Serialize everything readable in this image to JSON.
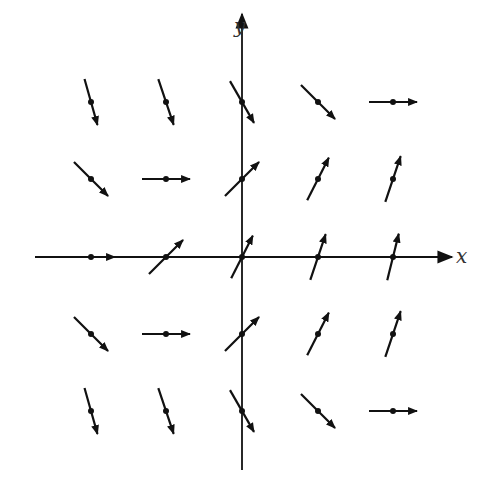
{
  "diagram": {
    "title": "",
    "type": "direction-field",
    "axes": {
      "x_label": "x",
      "y_label": "y",
      "origin_px": [
        242,
        257
      ],
      "x_axis_px": [
        35,
        452
      ],
      "y_axis_px": [
        470,
        14
      ],
      "color": "#111111"
    },
    "grid": {
      "x_values": [
        -2,
        -1,
        0,
        1,
        2
      ],
      "y_values": [
        2,
        1,
        0,
        -1,
        -2
      ],
      "x_px": [
        91,
        166,
        242,
        318,
        393
      ],
      "y_px": [
        102,
        179,
        257,
        334,
        411
      ]
    },
    "arrow_color": "#111111",
    "arrows": [
      {
        "x": -2,
        "y": 2,
        "dx": 0.27,
        "dy": 0.96
      },
      {
        "x": -1,
        "y": 2,
        "dx": 0.32,
        "dy": 0.95
      },
      {
        "x": 0,
        "y": 2,
        "dx": 0.5,
        "dy": 0.87
      },
      {
        "x": 1,
        "y": 2,
        "dx": 0.71,
        "dy": 0.71
      },
      {
        "x": 2,
        "y": 2,
        "dx": 1.0,
        "dy": 0.0
      },
      {
        "x": -2,
        "y": 1,
        "dx": 0.71,
        "dy": 0.71
      },
      {
        "x": -1,
        "y": 1,
        "dx": 1.0,
        "dy": 0.0
      },
      {
        "x": 0,
        "y": 1,
        "dx": 0.71,
        "dy": -0.71
      },
      {
        "x": 1,
        "y": 1,
        "dx": 0.45,
        "dy": -0.89
      },
      {
        "x": 2,
        "y": 1,
        "dx": 0.32,
        "dy": -0.95
      },
      {
        "x": -2,
        "y": 0,
        "dx": 1.0,
        "dy": 0.0
      },
      {
        "x": -1,
        "y": 0,
        "dx": 0.71,
        "dy": -0.71
      },
      {
        "x": 0,
        "y": 0,
        "dx": 0.45,
        "dy": -0.89
      },
      {
        "x": 1,
        "y": 0,
        "dx": 0.32,
        "dy": -0.95
      },
      {
        "x": 2,
        "y": 0,
        "dx": 0.24,
        "dy": -0.97
      },
      {
        "x": -2,
        "y": -1,
        "dx": 0.71,
        "dy": 0.71
      },
      {
        "x": -1,
        "y": -1,
        "dx": 1.0,
        "dy": 0.0
      },
      {
        "x": 0,
        "y": -1,
        "dx": 0.71,
        "dy": -0.71
      },
      {
        "x": 1,
        "y": -1,
        "dx": 0.45,
        "dy": -0.89
      },
      {
        "x": 2,
        "y": -1,
        "dx": 0.32,
        "dy": -0.95
      },
      {
        "x": -2,
        "y": -2,
        "dx": 0.27,
        "dy": 0.96
      },
      {
        "x": -1,
        "y": -2,
        "dx": 0.32,
        "dy": 0.95
      },
      {
        "x": 0,
        "y": -2,
        "dx": 0.5,
        "dy": 0.87
      },
      {
        "x": 1,
        "y": -2,
        "dx": 0.71,
        "dy": 0.71
      },
      {
        "x": 2,
        "y": -2,
        "dx": 1.0,
        "dy": 0.0
      }
    ],
    "arrow_half_length_px": 24
  }
}
